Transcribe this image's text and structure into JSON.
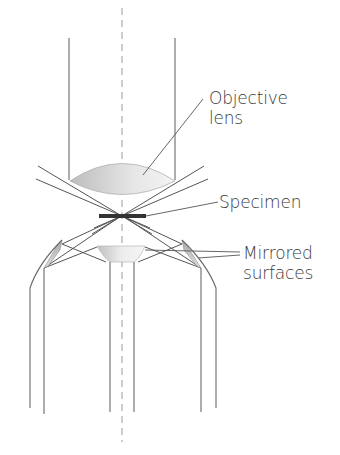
{
  "diagram": {
    "type": "optical-schematic",
    "labels": {
      "objective_line1": "Objective",
      "objective_line2": "lens",
      "specimen": "Specimen",
      "mirrored_line1": "Mirrored",
      "mirrored_line2": "surfaces"
    },
    "colors": {
      "line": "#555555",
      "specimen": "#333333",
      "lens_fill": "#c8c8c8",
      "dashed_axis": "#9a9a9a",
      "text": "#3a3a3a"
    }
  }
}
